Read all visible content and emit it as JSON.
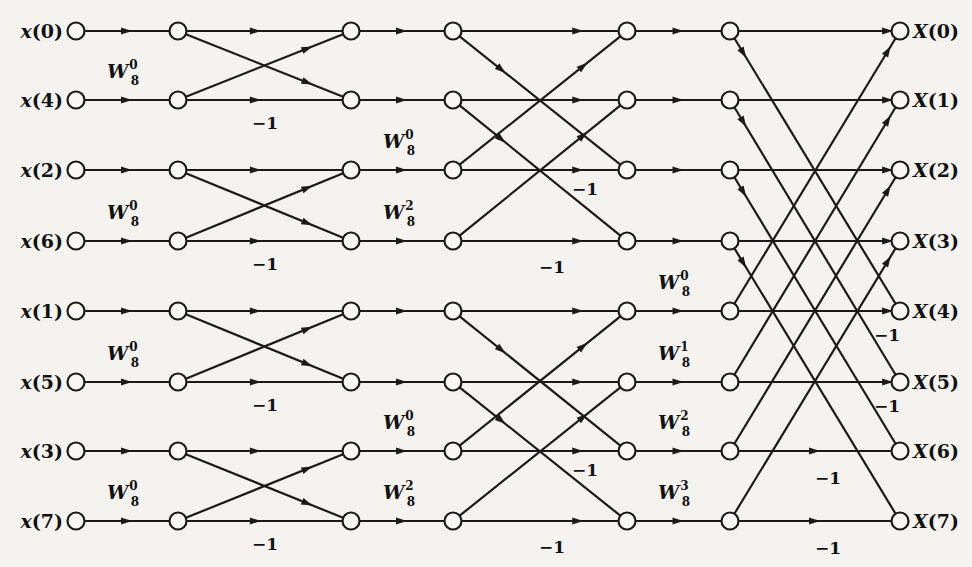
{
  "diagram": {
    "columns_x": [
      76,
      178,
      351,
      453,
      627,
      730,
      900
    ],
    "rows_y": [
      31,
      100,
      170,
      241,
      311,
      382,
      451,
      521
    ],
    "inputs": [
      {
        "label": "x(0)",
        "var": "x",
        "index": "0"
      },
      {
        "label": "x(4)",
        "var": "x",
        "index": "4"
      },
      {
        "label": "x(2)",
        "var": "x",
        "index": "2"
      },
      {
        "label": "x(6)",
        "var": "x",
        "index": "6"
      },
      {
        "label": "x(1)",
        "var": "x",
        "index": "1"
      },
      {
        "label": "x(5)",
        "var": "x",
        "index": "5"
      },
      {
        "label": "x(3)",
        "var": "x",
        "index": "3"
      },
      {
        "label": "x(7)",
        "var": "x",
        "index": "7"
      }
    ],
    "outputs": [
      {
        "label": "X(0)",
        "var": "X",
        "index": "0"
      },
      {
        "label": "X(1)",
        "var": "X",
        "index": "1"
      },
      {
        "label": "X(2)",
        "var": "X",
        "index": "2"
      },
      {
        "label": "X(3)",
        "var": "X",
        "index": "3"
      },
      {
        "label": "X(4)",
        "var": "X",
        "index": "4"
      },
      {
        "label": "X(5)",
        "var": "X",
        "index": "5"
      },
      {
        "label": "X(6)",
        "var": "X",
        "index": "6"
      },
      {
        "label": "X(7)",
        "var": "X",
        "index": "7"
      }
    ],
    "stage1_twiddles": [
      {
        "base": "W",
        "sub": "8",
        "sup": "0",
        "row": 1
      },
      {
        "base": "W",
        "sub": "8",
        "sup": "0",
        "row": 3
      },
      {
        "base": "W",
        "sub": "8",
        "sup": "0",
        "row": 5
      },
      {
        "base": "W",
        "sub": "8",
        "sup": "0",
        "row": 7
      }
    ],
    "stage2_twiddles": [
      {
        "base": "W",
        "sub": "8",
        "sup": "0",
        "row": 2
      },
      {
        "base": "W",
        "sub": "8",
        "sup": "2",
        "row": 3
      },
      {
        "base": "W",
        "sub": "8",
        "sup": "0",
        "row": 6
      },
      {
        "base": "W",
        "sub": "8",
        "sup": "2",
        "row": 7
      }
    ],
    "stage3_twiddles": [
      {
        "base": "W",
        "sub": "8",
        "sup": "0",
        "row": 4
      },
      {
        "base": "W",
        "sub": "8",
        "sup": "1",
        "row": 5
      },
      {
        "base": "W",
        "sub": "8",
        "sup": "2",
        "row": 6
      },
      {
        "base": "W",
        "sub": "8",
        "sup": "3",
        "row": 7
      }
    ],
    "minus_one_label": "−1",
    "stage1_minus_rows": [
      1,
      3,
      5,
      7
    ],
    "stage2_minus_rows": [
      2,
      3,
      6,
      7
    ],
    "stage3_minus_rows": [
      4,
      5,
      6,
      7
    ],
    "colors": {
      "background": "#f4f3f0",
      "ink": "#1a1a1a",
      "node_fill": "#f8f7f4"
    }
  }
}
